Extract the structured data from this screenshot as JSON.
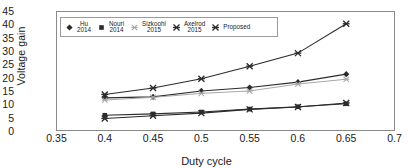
{
  "chart_data": {
    "type": "line",
    "title": "",
    "xlabel": "Duty cycle",
    "ylabel": "Voltage gain",
    "xlim": [
      0.35,
      0.7
    ],
    "ylim": [
      0,
      45
    ],
    "xticks": [
      "0.35",
      "0.4",
      "0.45",
      "0.5",
      "0.55",
      "0.6",
      "0.65",
      "0.7"
    ],
    "yticks": [
      "0",
      "5",
      "10",
      "15",
      "20",
      "25",
      "30",
      "35",
      "40",
      "45"
    ],
    "x": [
      0.4,
      0.45,
      0.5,
      0.55,
      0.6,
      0.65
    ],
    "grid": false,
    "legend_position": "top-left",
    "series": [
      {
        "name": "Hu",
        "year": "2014",
        "marker": "diamond",
        "color": "#2b2b2b",
        "values": [
          12.6,
          13.0,
          15.2,
          16.5,
          18.5,
          21.5
        ]
      },
      {
        "name": "Nouri",
        "year": "2014",
        "marker": "square",
        "color": "#2b2b2b",
        "values": [
          6.1,
          6.6,
          7.3,
          8.4,
          9.3,
          10.4
        ]
      },
      {
        "name": "Sizkoohi",
        "year": "2015",
        "marker": "asterisk-light",
        "color": "#a8a8a8",
        "values": [
          11.8,
          12.8,
          14.3,
          15.2,
          17.8,
          19.6
        ]
      },
      {
        "name": "Axelrod",
        "year": "2015",
        "marker": "asterisk",
        "color": "#2b2b2b",
        "values": [
          4.9,
          5.9,
          6.9,
          8.3,
          9.2,
          10.7
        ]
      },
      {
        "name": "Proposed",
        "year": "",
        "marker": "asterisk",
        "color": "#2b2b2b",
        "values": [
          13.9,
          16.3,
          19.8,
          24.5,
          29.4,
          40.4
        ]
      }
    ]
  },
  "legend": [
    {
      "label": "Hu",
      "year": "2014"
    },
    {
      "label": "Nouri",
      "year": "2014"
    },
    {
      "label": "Sizkoohi",
      "year": "2015"
    },
    {
      "label": "Axelrod",
      "year": "2015"
    },
    {
      "label": "Proposed",
      "year": ""
    }
  ]
}
